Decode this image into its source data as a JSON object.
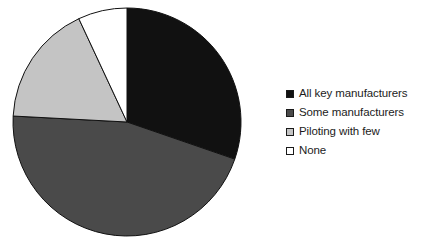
{
  "chart_data": {
    "type": "pie",
    "title": "",
    "subtitle": "",
    "xlabel": "",
    "ylabel": "",
    "grid": false,
    "legend_position": "right",
    "start_angle_deg": 0,
    "direction": "clockwise",
    "categories": [
      "All key manufacturers",
      "Some manufacturers",
      "Piloting with few",
      "None"
    ],
    "values": [
      30,
      46,
      17,
      7
    ],
    "units": "percent",
    "slices": [
      {
        "label": "All key manufacturers",
        "value": 30,
        "start_deg": 0,
        "end_deg": 109,
        "color": "#111111",
        "edge_color": "#111111"
      },
      {
        "label": "Some manufacturers",
        "value": 46,
        "start_deg": 109,
        "end_deg": 273,
        "color": "#4a4a4a",
        "edge_color": "#111111"
      },
      {
        "label": "Piloting with few",
        "value": 17,
        "start_deg": 273,
        "end_deg": 335,
        "color": "#c4c4c4",
        "edge_color": "#111111"
      },
      {
        "label": "None",
        "value": 7,
        "start_deg": 335,
        "end_deg": 360,
        "color": "#ffffff",
        "edge_color": "#111111"
      }
    ]
  },
  "legend": {
    "items": [
      {
        "label": "All key manufacturers",
        "swatch": "#111111",
        "swatch_name": "legend-swatch-black"
      },
      {
        "label": "Some manufacturers",
        "swatch": "#4a4a4a",
        "swatch_name": "legend-swatch-dark-gray"
      },
      {
        "label": "Piloting with few",
        "swatch": "#c4c4c4",
        "swatch_name": "legend-swatch-light-gray"
      },
      {
        "label": "None",
        "swatch": "#ffffff",
        "swatch_name": "legend-swatch-white"
      }
    ]
  },
  "colors": {
    "all_key_manufacturers": "#111111",
    "some_manufacturers": "#4a4a4a",
    "piloting_with_few": "#c4c4c4",
    "none": "#ffffff",
    "outline": "#111111",
    "background": "#ffffff",
    "text": "#1c1c1c"
  },
  "geometry": {
    "center_x": 127,
    "center_y": 122,
    "radius": 114
  }
}
